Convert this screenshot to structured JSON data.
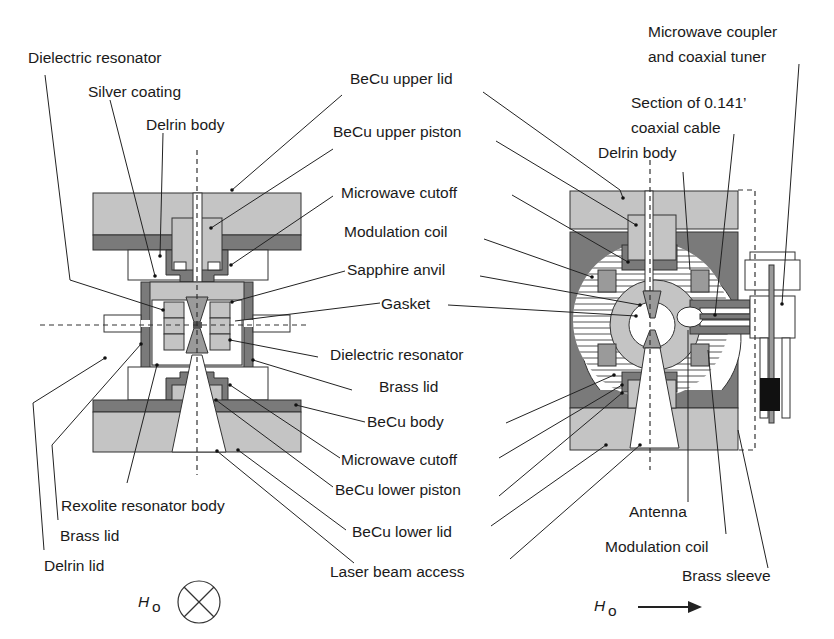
{
  "figure": {
    "left_view": {
      "title": "Cross-section, field into page",
      "labels": {
        "dielectric_resonator_top": "Dielectric resonator",
        "silver_coating": "Silver coating",
        "delrin_body": "Delrin body",
        "becu_upper_lid": "BeCu upper lid",
        "becu_upper_piston": "BeCu upper piston",
        "microwave_cutoff_top": "Microwave cutoff",
        "modulation_coil": "Modulation coil",
        "sapphire_anvil": "Sapphire anvil",
        "gasket": "Gasket",
        "dielectric_resonator_mid": "Dielectric resonator",
        "brass_lid_mid": "Brass lid",
        "becu_body": "BeCu body",
        "microwave_cutoff_bottom": "Microwave cutoff",
        "becu_lower_piston": "BeCu lower piston",
        "becu_lower_lid": "BeCu lower lid",
        "laser_beam_access": "Laser beam access",
        "rexolite_resonator_body": "Rexolite resonator body",
        "brass_lid_left": "Brass lid",
        "delrin_lid": "Delrin lid"
      },
      "field_symbol": {
        "label": "H",
        "subscript": "o",
        "direction": "into-page"
      }
    },
    "right_view": {
      "labels": {
        "microwave_coupler_line1": "Microwave coupler",
        "microwave_coupler_line2": "and coaxial tuner",
        "coax_section_line1": "Section of 0.141’",
        "coax_section_line2": "coaxial cable",
        "delrin_body": "Delrin body",
        "antenna": "Antenna",
        "modulation_coil": "Modulation coil",
        "brass_sleeve": "Brass sleeve"
      },
      "field_symbol": {
        "label": "H",
        "subscript": "o",
        "direction": "right-arrow"
      }
    },
    "colors": {
      "light_gray": "#c4c4c4",
      "dark_gray": "#7a7a7a",
      "medium_gray": "#9a9a9a",
      "black": "#111111",
      "line": "#222222"
    }
  }
}
